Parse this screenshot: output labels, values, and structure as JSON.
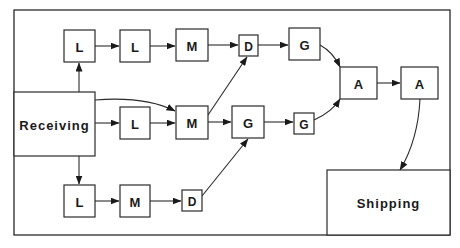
{
  "diagram": {
    "frame": {
      "x": 14,
      "y": 10,
      "w": 436,
      "h": 225
    },
    "stations": {
      "receiving": {
        "label": "Receiving",
        "x": 14,
        "y": 92,
        "w": 81,
        "h": 64
      },
      "shipping": {
        "label": "Shipping",
        "x": 327,
        "y": 170,
        "w": 123,
        "h": 65
      }
    },
    "nodes": [
      {
        "id": "top-l1",
        "label": "L",
        "x": 64,
        "y": 30,
        "w": 31,
        "h": 32
      },
      {
        "id": "top-l2",
        "label": "L",
        "x": 120,
        "y": 30,
        "w": 30,
        "h": 32
      },
      {
        "id": "top-m",
        "label": "M",
        "x": 176,
        "y": 29,
        "w": 32,
        "h": 32
      },
      {
        "id": "top-d",
        "label": "D",
        "x": 239,
        "y": 35,
        "w": 19,
        "h": 21
      },
      {
        "id": "top-g",
        "label": "G",
        "x": 289,
        "y": 28,
        "w": 31,
        "h": 32
      },
      {
        "id": "mid-l",
        "label": "L",
        "x": 120,
        "y": 107,
        "w": 30,
        "h": 32
      },
      {
        "id": "mid-m",
        "label": "M",
        "x": 176,
        "y": 106,
        "w": 32,
        "h": 33
      },
      {
        "id": "mid-g1",
        "label": "G",
        "x": 232,
        "y": 106,
        "w": 32,
        "h": 32
      },
      {
        "id": "mid-g2",
        "label": "G",
        "x": 294,
        "y": 113,
        "w": 20,
        "h": 21
      },
      {
        "id": "a1",
        "label": "A",
        "x": 340,
        "y": 67,
        "w": 37,
        "h": 32
      },
      {
        "id": "a2",
        "label": "A",
        "x": 401,
        "y": 67,
        "w": 37,
        "h": 32
      },
      {
        "id": "bot-l",
        "label": "L",
        "x": 64,
        "y": 185,
        "w": 31,
        "h": 32
      },
      {
        "id": "bot-m",
        "label": "M",
        "x": 120,
        "y": 185,
        "w": 30,
        "h": 32
      },
      {
        "id": "bot-d",
        "label": "D",
        "x": 182,
        "y": 190,
        "w": 20,
        "h": 21
      }
    ],
    "edges": [
      {
        "from": "receiving",
        "to": "top-l1",
        "d": "M79 92 L79 63"
      },
      {
        "from": "top-l1",
        "to": "top-l2",
        "d": "M95 46 L119 46"
      },
      {
        "from": "top-l2",
        "to": "top-m",
        "d": "M150 46 L175 46"
      },
      {
        "from": "top-m",
        "to": "top-d",
        "d": "M208 45 L238 45"
      },
      {
        "from": "top-d",
        "to": "top-g",
        "d": "M258 45 L288 45"
      },
      {
        "from": "top-g",
        "to": "a1",
        "d": "M320 45 Q333 52 340 67"
      },
      {
        "from": "receiving",
        "to": "mid-m",
        "d": "M95 100 Q145 96 175 111"
      },
      {
        "from": "receiving",
        "to": "mid-l",
        "d": "M95 123 L119 123"
      },
      {
        "from": "mid-l",
        "to": "mid-m",
        "d": "M150 123 L175 123"
      },
      {
        "from": "mid-m",
        "to": "top-d",
        "d": "M208 115 L247 57"
      },
      {
        "from": "mid-m",
        "to": "mid-g1",
        "d": "M208 122 L231 122"
      },
      {
        "from": "mid-g1",
        "to": "mid-g2",
        "d": "M264 122 L293 122"
      },
      {
        "from": "mid-g2",
        "to": "a1",
        "d": "M314 120 Q332 112 340 99"
      },
      {
        "from": "a1",
        "to": "a2",
        "d": "M377 83 L400 83"
      },
      {
        "from": "a2",
        "to": "shipping",
        "d": "M420 99 Q418 140 400 170"
      },
      {
        "from": "receiving",
        "to": "bot-l",
        "d": "M79 156 L79 184"
      },
      {
        "from": "bot-l",
        "to": "bot-m",
        "d": "M95 201 L119 201"
      },
      {
        "from": "bot-m",
        "to": "bot-d",
        "d": "M150 201 L181 201"
      },
      {
        "from": "bot-d",
        "to": "mid-g1",
        "d": "M202 196 L248 139"
      }
    ]
  }
}
